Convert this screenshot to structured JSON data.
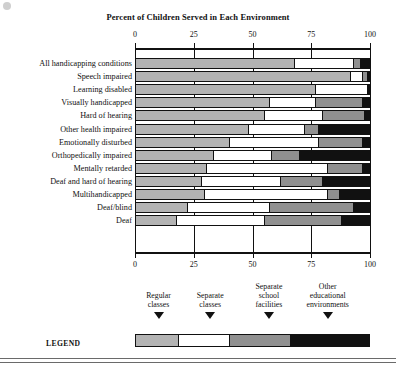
{
  "chart_data": {
    "type": "bar",
    "orientation": "horizontal",
    "stacked": true,
    "title": "Percent of Children Served in Each Environment",
    "xlabel": "",
    "ylabel": "",
    "xlim": [
      0,
      100
    ],
    "xticks": [
      0,
      25,
      50,
      75,
      100
    ],
    "xticklabels": [
      "0",
      "25",
      "50",
      "75",
      "100"
    ],
    "grid": true,
    "legend_position": "bottom",
    "legend_title": "LEGEND",
    "series": [
      {
        "name": "Regular classes",
        "color": "#b3b3b3",
        "values": [
          68,
          92,
          77,
          57,
          55,
          48,
          40,
          33,
          30,
          28,
          29,
          22,
          17
        ]
      },
      {
        "name": "Separate classes",
        "color": "#ffffff",
        "values": [
          25,
          5,
          22,
          20,
          25,
          24,
          38,
          25,
          52,
          34,
          53,
          35,
          38
        ]
      },
      {
        "name": "Separate school facilities",
        "color": "#909090",
        "values": [
          3,
          2,
          0,
          20,
          18,
          6,
          19,
          12,
          15,
          18,
          5,
          36,
          33
        ]
      },
      {
        "name": "Other educational environments",
        "color": "#111111",
        "values": [
          4,
          1,
          1,
          3,
          2,
          22,
          3,
          30,
          3,
          20,
          13,
          7,
          12
        ]
      }
    ],
    "categories": [
      "All handicapping conditions",
      "Speech impaired",
      "Learning disabled",
      "Visually handicapped",
      "Hard of hearing",
      "Other health impaired",
      "Emotionally disturbed",
      "Orthopedically impaired",
      "Mentally retarded",
      "Deaf and hard of hearing",
      "Multihandicapped",
      "Deaf/blind",
      "Deaf"
    ]
  },
  "legend": {
    "label": "LEGEND",
    "items": [
      {
        "label_line1": "Regular",
        "label_line2": "classes",
        "center_pct": 10
      },
      {
        "label_line1": "Separate",
        "label_line2": "classes",
        "center_pct": 32
      },
      {
        "label_line1": "Separate",
        "label_line2": "school",
        "label_line3": "facilities",
        "center_pct": 57
      },
      {
        "label_line1": "Other",
        "label_line2": "educational",
        "label_line3": "environments",
        "center_pct": 82
      }
    ],
    "bar_segments": [
      18,
      22,
      26,
      34
    ]
  },
  "colors": {
    "regular_classes": "#b3b3b3",
    "separate_classes": "#ffffff",
    "separate_school_facilities": "#909090",
    "other_educational_environments": "#111111",
    "axis": "#111111",
    "page_background": "#ffffff"
  }
}
